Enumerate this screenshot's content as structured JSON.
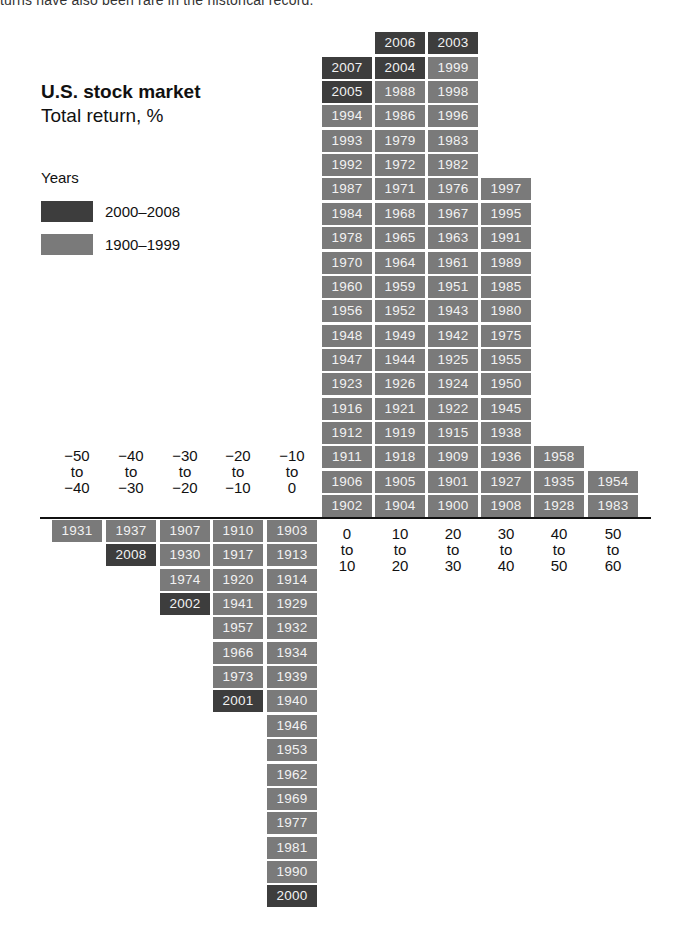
{
  "intro_text": "turns have also been rare in the historical record.",
  "chart_data": {
    "type": "histogram-stacked-years",
    "title": "U.S. stock market",
    "subtitle": "Total return, %",
    "legend_title": "Years",
    "legend": [
      {
        "label": "2000–2008",
        "color": "#3d3d3d"
      },
      {
        "label": "1900–1999",
        "color": "#7a7a7a"
      }
    ],
    "colors": {
      "recent": "#3d3d3d",
      "historic": "#7a7a7a",
      "axis": "#111111"
    },
    "xlabel": "Total return, %",
    "bins": [
      {
        "label": [
          "−50",
          "to",
          "−40"
        ],
        "range": [
          -50,
          -40
        ],
        "side": "below",
        "years": [
          "1931"
        ]
      },
      {
        "label": [
          "−40",
          "to",
          "−30"
        ],
        "range": [
          -40,
          -30
        ],
        "side": "below",
        "years": [
          "1937",
          "2008"
        ]
      },
      {
        "label": [
          "−30",
          "to",
          "−20"
        ],
        "range": [
          -30,
          -20
        ],
        "side": "below",
        "years": [
          "1907",
          "1930",
          "1974",
          "2002"
        ]
      },
      {
        "label": [
          "−20",
          "to",
          "−10"
        ],
        "range": [
          -20,
          -10
        ],
        "side": "below",
        "years": [
          "1910",
          "1917",
          "1920",
          "1941",
          "1957",
          "1966",
          "1973",
          "2001"
        ]
      },
      {
        "label": [
          "−10",
          "to",
          "0"
        ],
        "range": [
          -10,
          0
        ],
        "side": "below",
        "years": [
          "1903",
          "1913",
          "1914",
          "1929",
          "1932",
          "1934",
          "1939",
          "1940",
          "1946",
          "1953",
          "1962",
          "1969",
          "1977",
          "1981",
          "1990",
          "2000"
        ]
      },
      {
        "label": [
          "0",
          "to",
          "10"
        ],
        "range": [
          0,
          10
        ],
        "side": "above",
        "years": [
          "1902",
          "1906",
          "1911",
          "1912",
          "1916",
          "1923",
          "1947",
          "1948",
          "1956",
          "1960",
          "1970",
          "1978",
          "1984",
          "1987",
          "1992",
          "1993",
          "1994",
          "2005",
          "2007"
        ]
      },
      {
        "label": [
          "10",
          "to",
          "20"
        ],
        "range": [
          10,
          20
        ],
        "side": "above",
        "years": [
          "1904",
          "1905",
          "1918",
          "1919",
          "1921",
          "1926",
          "1944",
          "1949",
          "1952",
          "1959",
          "1964",
          "1965",
          "1968",
          "1971",
          "1972",
          "1979",
          "1986",
          "1988",
          "2004",
          "2006"
        ]
      },
      {
        "label": [
          "20",
          "to",
          "30"
        ],
        "range": [
          20,
          30
        ],
        "side": "above",
        "years": [
          "1900",
          "1901",
          "1909",
          "1915",
          "1922",
          "1924",
          "1925",
          "1942",
          "1943",
          "1951",
          "1961",
          "1963",
          "1967",
          "1976",
          "1982",
          "1983",
          "1996",
          "1998",
          "1999",
          "2003"
        ]
      },
      {
        "label": [
          "30",
          "to",
          "40"
        ],
        "range": [
          30,
          40
        ],
        "side": "above",
        "years": [
          "1908",
          "1927",
          "1936",
          "1938",
          "1945",
          "1950",
          "1955",
          "1975",
          "1980",
          "1985",
          "1989",
          "1991",
          "1995",
          "1997"
        ]
      },
      {
        "label": [
          "40",
          "to",
          "50"
        ],
        "range": [
          40,
          50
        ],
        "side": "above",
        "years": [
          "1928",
          "1935",
          "1958"
        ]
      },
      {
        "label": [
          "50",
          "to",
          "60"
        ],
        "range": [
          50,
          60
        ],
        "side": "above",
        "years": [
          "1983",
          "1954"
        ]
      }
    ],
    "counts": [
      1,
      2,
      4,
      8,
      16,
      19,
      20,
      20,
      14,
      3,
      2
    ],
    "grid": false
  }
}
